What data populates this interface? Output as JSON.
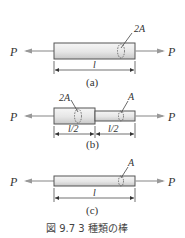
{
  "figure": {
    "caption": "図 9.7  3 種類の棒",
    "force_label": "P",
    "colors": {
      "bar_fill_top": "#f4f4f4",
      "bar_fill_bottom": "#cfcfcf",
      "stroke": "#555555",
      "arrow": "#999999"
    },
    "panels": [
      {
        "id": "a",
        "sub_label": "(a)",
        "area_labels": [
          "2A"
        ],
        "length_labels": [
          "l"
        ]
      },
      {
        "id": "b",
        "sub_label": "(b)",
        "area_labels": [
          "2A",
          "A"
        ],
        "length_labels": [
          "l/2",
          "l/2"
        ]
      },
      {
        "id": "c",
        "sub_label": "(c)",
        "area_labels": [
          "A"
        ],
        "length_labels": [
          "l"
        ]
      }
    ]
  }
}
